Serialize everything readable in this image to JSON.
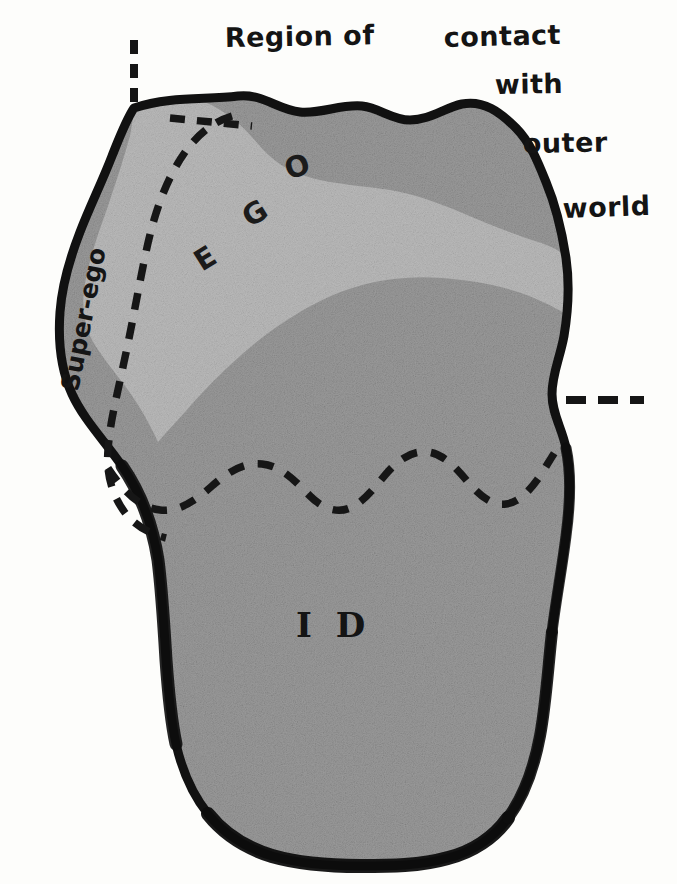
{
  "figure": {
    "background_color": "#fdfdfb",
    "outline_color": "#111111",
    "id_fill_color": "#9b9b9b",
    "ego_fill_color": "#b9b9b9",
    "texture": "halftone-grain"
  },
  "caption": {
    "lines": [
      {
        "text": "Region of",
        "x": 225,
        "y": 47
      },
      {
        "text": "contact",
        "x": 444,
        "y": 47
      },
      {
        "text": "with",
        "x": 495,
        "y": 94
      },
      {
        "text": "outer",
        "x": 523,
        "y": 153
      },
      {
        "text": "world",
        "x": 563,
        "y": 218
      }
    ],
    "full_text": "Region of contact with outer world"
  },
  "regions": [
    {
      "name": "ego",
      "label_letters": [
        {
          "char": "E",
          "x": 202,
          "y": 272,
          "rotate": -32
        },
        {
          "char": "G",
          "x": 250,
          "y": 228,
          "rotate": -32
        },
        {
          "char": "O",
          "x": 289,
          "y": 180,
          "rotate": -20
        }
      ],
      "label_text": "EGO",
      "fill": "#b9b9b9"
    },
    {
      "name": "id",
      "label_text": "I D",
      "label_x": 296,
      "label_y": 637,
      "fill": "#9b9b9b"
    },
    {
      "name": "super-ego",
      "label_text": "Super-ego",
      "label_x": 78,
      "label_y": 390,
      "rotate": -79,
      "fill": "#9b9b9b"
    }
  ],
  "markers": {
    "top_dashed_tick": {
      "name": "perception-consciousness-marker",
      "x": 134,
      "y_start": 40,
      "y_end": 108
    },
    "right_dashed_tick": {
      "name": "repression-level-marker",
      "y": 400,
      "x_start": 566,
      "x_end": 642
    },
    "acoustic_dashed_segment": {
      "name": "pcpt-cs-dashed-segment",
      "description": "short dashed line running right from the super-ego curve to the outline near the top"
    },
    "repressed_boundary": {
      "name": "repressed-zigzag-boundary",
      "description": "scalloped dashed line separating the preconscious from the repressed id"
    }
  },
  "legend_note": ""
}
